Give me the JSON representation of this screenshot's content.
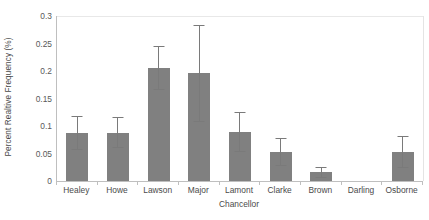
{
  "chart_data": {
    "type": "bar",
    "title": "",
    "xlabel": "Chancellor",
    "ylabel": "Percent Realtive Frequency (%)",
    "categories": [
      "Healey",
      "Howe",
      "Lawson",
      "Major",
      "Lamont",
      "Clarke",
      "Brown",
      "Darling",
      "Osborne"
    ],
    "values": [
      0.088,
      0.088,
      0.206,
      0.196,
      0.089,
      0.053,
      0.016,
      0,
      0.053
    ],
    "errors": [
      0.031,
      0.028,
      0.04,
      0.088,
      0.037,
      0.025,
      0.01,
      0,
      0.029
    ],
    "ylim": [
      0,
      0.3
    ],
    "ytick_labels": [
      "0",
      "0.05",
      "0.1",
      "0.15",
      "0.2",
      "0.25",
      "0.3"
    ],
    "ytick_values": [
      0,
      0.05,
      0.1,
      0.15,
      0.2,
      0.25,
      0.3
    ],
    "grid": true,
    "legend": "none",
    "series_name": "Percent Relative Frequency",
    "bar_color": "#808080",
    "error_color": "#7a7a7a",
    "axis_color": "#bfbfbf",
    "grid_color": "#e8e8e8",
    "text_color": "#4a4a4a"
  }
}
